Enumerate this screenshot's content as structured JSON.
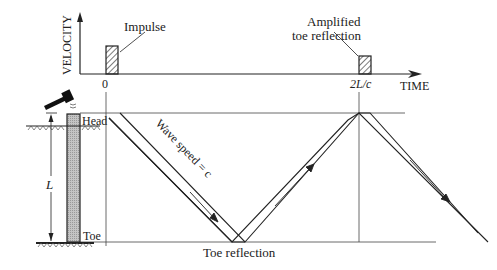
{
  "figure": {
    "velocity_axis_label": "VELOCITY",
    "time_axis_label": "TIME",
    "time_zero_label": "0",
    "time_2lc_label": "2L/c",
    "impulse_label": "Impulse",
    "amplified_label_line1": "Amplified",
    "amplified_label_line2": "toe reflection",
    "head_label": "Head",
    "toe_label": "Toe",
    "length_label": "L",
    "wave_speed_label": "Wave speed = c",
    "toe_reflection_label": "Toe reflection"
  },
  "colors": {
    "line": "#222222",
    "pile_fill": "#b8b8b8",
    "background": "#ffffff"
  }
}
